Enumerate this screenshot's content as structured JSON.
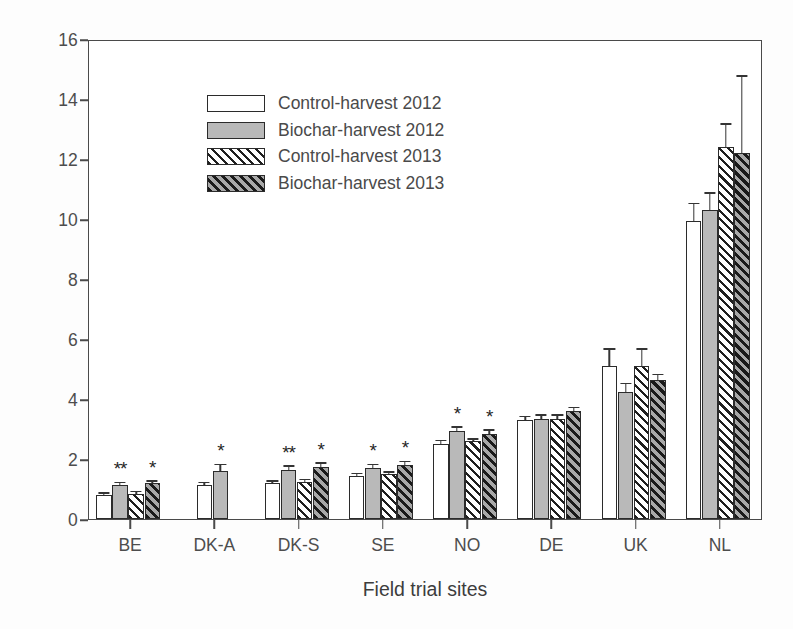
{
  "chart_data": {
    "type": "bar",
    "title": "",
    "xlabel": "Field trial sites",
    "ylabel": "% Soil organic carbon",
    "ylim": [
      0,
      16
    ],
    "yticks": [
      0,
      2,
      4,
      6,
      8,
      10,
      12,
      14,
      16
    ],
    "grid": false,
    "legend_position": "upper left",
    "categories": [
      "BE",
      "DK-A",
      "DK-S",
      "SE",
      "NO",
      "DE",
      "UK",
      "NL"
    ],
    "series": [
      {
        "name": "Control-harvest 2012",
        "fill": "open",
        "values": [
          0.8,
          1.15,
          1.2,
          1.45,
          2.5,
          3.3,
          5.1,
          9.95
        ],
        "errors": [
          0.05,
          0.05,
          0.05,
          0.05,
          0.1,
          0.1,
          0.55,
          0.55
        ]
      },
      {
        "name": "Biochar-harvest 2012",
        "fill": "gray",
        "values": [
          1.15,
          1.6,
          1.65,
          1.7,
          2.95,
          3.35,
          4.25,
          10.3
        ],
        "errors": [
          0.05,
          0.2,
          0.1,
          0.1,
          0.1,
          0.1,
          0.25,
          0.55
        ]
      },
      {
        "name": "Control-harvest 2013",
        "fill": "hatch-light",
        "values": [
          0.85,
          null,
          1.25,
          1.5,
          2.6,
          3.35,
          5.1,
          12.4
        ],
        "errors": [
          0.05,
          null,
          0.05,
          0.05,
          0.05,
          0.1,
          0.55,
          0.75
        ]
      },
      {
        "name": "Biochar-harvest 2013",
        "fill": "hatch-dark",
        "values": [
          1.2,
          null,
          1.75,
          1.8,
          2.85,
          3.6,
          4.65,
          12.2
        ],
        "errors": [
          0.05,
          null,
          0.1,
          0.1,
          0.1,
          0.1,
          0.15,
          2.55
        ]
      }
    ],
    "annotations": [
      {
        "category": "BE",
        "series": "Biochar-harvest 2012",
        "text": "**"
      },
      {
        "category": "BE",
        "series": "Biochar-harvest 2013",
        "text": "*"
      },
      {
        "category": "DK-A",
        "series": "Biochar-harvest 2012",
        "text": "*"
      },
      {
        "category": "DK-S",
        "series": "Biochar-harvest 2012",
        "text": "**"
      },
      {
        "category": "DK-S",
        "series": "Biochar-harvest 2013",
        "text": "*"
      },
      {
        "category": "SE",
        "series": "Biochar-harvest 2012",
        "text": "*"
      },
      {
        "category": "SE",
        "series": "Biochar-harvest 2013",
        "text": "*"
      },
      {
        "category": "NO",
        "series": "Biochar-harvest 2012",
        "text": "*"
      },
      {
        "category": "NO",
        "series": "Biochar-harvest 2013",
        "text": "*"
      }
    ],
    "colors": {
      "open": "#ffffff",
      "gray": "#b9b9b9",
      "hatch_line": "#1f1f1f",
      "axis": "#4a4a4a",
      "text": "#4d4d4d"
    }
  }
}
